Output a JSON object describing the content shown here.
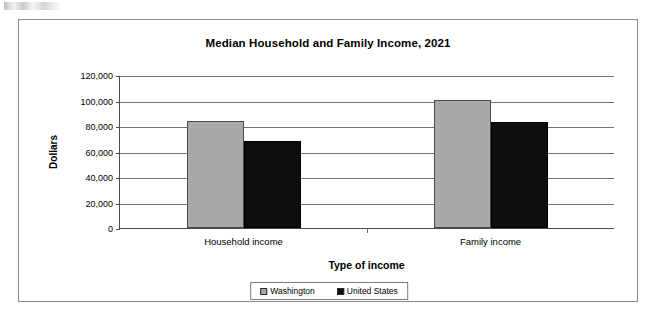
{
  "scan_artifact": "",
  "chart_data": {
    "type": "bar",
    "title": "Median Household and Family Income, 2021",
    "xlabel": "Type of income",
    "ylabel": "Dollars",
    "categories": [
      "Household income",
      "Family income"
    ],
    "series": [
      {
        "name": "Washington",
        "color": "#a9a9a9",
        "values": [
          84000,
          100500
        ]
      },
      {
        "name": "United States",
        "color": "#0d0d0d",
        "values": [
          68000,
          83000
        ]
      }
    ],
    "ylim": [
      0,
      120000
    ],
    "ytick_values": [
      0,
      20000,
      40000,
      60000,
      80000,
      100000,
      120000
    ],
    "ytick_labels": [
      "0",
      "20,000",
      "40,000",
      "60,000",
      "80,000",
      "100,000",
      "120,000"
    ],
    "grid": true,
    "legend_position": "bottom-center"
  }
}
